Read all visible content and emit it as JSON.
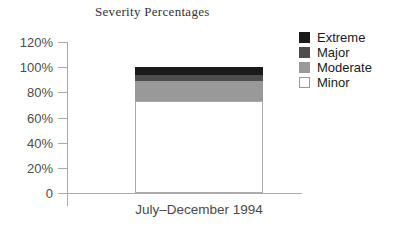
{
  "chart_data": {
    "type": "bar",
    "stacked": true,
    "title": "Severity Percentages",
    "categories": [
      "July–December 1994"
    ],
    "series": [
      {
        "name": "Minor",
        "values": [
          73
        ],
        "color": "#ffffff",
        "border": "#aaaaaa"
      },
      {
        "name": "Moderate",
        "values": [
          16
        ],
        "color": "#999999"
      },
      {
        "name": "Major",
        "values": [
          5
        ],
        "color": "#4d4d4d"
      },
      {
        "name": "Extreme",
        "values": [
          6
        ],
        "color": "#1a1a1a"
      }
    ],
    "xlabel": "",
    "ylabel": "",
    "ylim": [
      0,
      120
    ],
    "yticks": [
      {
        "value": 120,
        "label": "120%"
      },
      {
        "value": 100,
        "label": "100%"
      },
      {
        "value": 80,
        "label": "80%"
      },
      {
        "value": 60,
        "label": "60%"
      },
      {
        "value": 40,
        "label": "40%"
      },
      {
        "value": 20,
        "label": "20%"
      },
      {
        "value": 0,
        "label": "0"
      }
    ],
    "grid": false,
    "legend_position": "right",
    "legend": [
      {
        "label": "Extreme",
        "color": "#1a1a1a"
      },
      {
        "label": "Major",
        "color": "#4d4d4d"
      },
      {
        "label": "Moderate",
        "color": "#999999"
      },
      {
        "label": "Minor",
        "color": "#ffffff",
        "border": "#999999"
      }
    ]
  },
  "colors": {
    "axis": "#aaaaaa",
    "title_text": "#333333",
    "tick_text": "#4d4d4d",
    "legend_text": "#1a1a1a",
    "background": "#ffffff"
  }
}
